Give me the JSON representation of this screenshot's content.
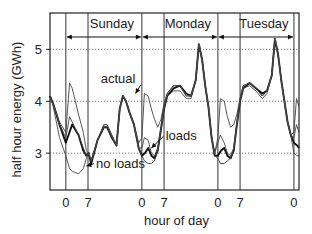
{
  "chart_data": {
    "type": "line",
    "title": "",
    "xlabel": "hour of day",
    "ylabel": "half hour energy (GWh)",
    "xlim": [
      -5,
      73.6
    ],
    "ylim": [
      2.29,
      5.7
    ],
    "yticks": [
      3,
      4,
      5
    ],
    "ytick_labels": [
      "3",
      "4",
      "5"
    ],
    "xticks": [
      0,
      7,
      24,
      31,
      48,
      55,
      72
    ],
    "xtick_labels": [
      "0",
      "7",
      "0",
      "7",
      "0",
      "7",
      "0"
    ],
    "grid": "horizontal dotted at y ticks",
    "day_spans": [
      {
        "label": "Sunday",
        "from": 0,
        "to": 24
      },
      {
        "label": "Monday",
        "from": 24,
        "to": 48
      },
      {
        "label": "Tuesday",
        "from": 48,
        "to": 72
      }
    ],
    "annotations": [
      {
        "text": "actual",
        "x": 11,
        "y": 4.35,
        "points_to": [
          22,
          4.15
        ]
      },
      {
        "text": "loads",
        "x": 31.5,
        "y": 3.25,
        "points_to": [
          27,
          3.1
        ]
      },
      {
        "text": "no loads",
        "x": 9.5,
        "y": 2.72,
        "points_to": [
          6.5,
          2.75
        ]
      }
    ],
    "series": [
      {
        "name": "actual",
        "style": "thick",
        "x": [
          -5,
          -4,
          -2,
          0,
          2,
          4,
          5.5,
          6.5,
          7.2,
          8,
          10,
          12,
          13,
          14.5,
          16,
          17,
          18,
          19,
          20,
          21.5,
          23,
          24,
          25,
          26,
          27,
          28,
          29,
          30,
          31,
          32,
          34,
          36,
          38,
          39.5,
          41,
          42,
          43,
          44,
          45,
          46,
          47,
          48,
          49,
          50,
          51,
          52,
          53,
          54,
          55,
          56,
          58,
          60,
          62,
          63.5,
          65,
          66,
          67,
          68,
          69,
          70,
          71,
          72,
          73,
          73.6
        ],
        "y": [
          4.1,
          3.95,
          3.55,
          3.2,
          3.55,
          3.35,
          3.05,
          2.95,
          3.0,
          2.8,
          3.25,
          3.5,
          3.5,
          3.3,
          3.15,
          3.85,
          4.1,
          4.0,
          3.8,
          3.55,
          3.1,
          2.95,
          3.0,
          3.1,
          2.95,
          2.9,
          3.05,
          3.45,
          3.85,
          4.1,
          4.25,
          4.3,
          4.15,
          4.1,
          4.4,
          5.1,
          4.8,
          4.3,
          3.9,
          3.3,
          2.95,
          2.95,
          3.05,
          3.1,
          2.95,
          2.9,
          3.05,
          3.55,
          4.0,
          4.25,
          4.35,
          4.25,
          4.15,
          4.2,
          4.5,
          5.2,
          4.9,
          4.4,
          4.0,
          3.6,
          3.35,
          3.2,
          3.15,
          3.1
        ]
      },
      {
        "name": "loads",
        "style": "thin",
        "x": [
          -5,
          -4,
          -2,
          0,
          1.2,
          2,
          4,
          5.5,
          6.5,
          7.2,
          8,
          10,
          12,
          13,
          14.5,
          16,
          17,
          18,
          19,
          20,
          21.5,
          23,
          24,
          24.8,
          26,
          27,
          28,
          29,
          30,
          31,
          32,
          34,
          36,
          38,
          39.5,
          41,
          42,
          43,
          44,
          45,
          46,
          47,
          48,
          48.8,
          50,
          51,
          52,
          53,
          54,
          55,
          56,
          58,
          60,
          62,
          63.5,
          65,
          66,
          67,
          68,
          69,
          70,
          71,
          72,
          72.8,
          73.6
        ],
        "y": [
          4.1,
          3.95,
          3.55,
          3.3,
          3.7,
          3.6,
          3.35,
          3.1,
          2.95,
          3.0,
          2.85,
          3.25,
          3.55,
          3.55,
          3.35,
          3.15,
          3.85,
          4.1,
          4.0,
          3.8,
          3.55,
          3.1,
          3.1,
          3.3,
          3.25,
          3.0,
          2.95,
          3.1,
          3.5,
          3.9,
          4.15,
          4.3,
          4.3,
          4.1,
          4.1,
          4.4,
          5.1,
          4.8,
          4.3,
          3.9,
          3.3,
          3.0,
          3.2,
          3.35,
          3.2,
          3.0,
          2.95,
          3.1,
          3.6,
          4.05,
          4.3,
          4.35,
          4.25,
          4.1,
          4.2,
          4.5,
          5.2,
          4.9,
          4.4,
          4.0,
          3.6,
          3.35,
          3.3,
          3.55,
          3.4
        ]
      },
      {
        "name": "no loads",
        "style": "thin",
        "x": [
          -5,
          -4,
          -2,
          0,
          1.2,
          2,
          4,
          5.5,
          6.5,
          7.2,
          8,
          10,
          12,
          13,
          14.5,
          16,
          17,
          18,
          19,
          20,
          21.5,
          23,
          24,
          24.8,
          26,
          27,
          28,
          29,
          30,
          31,
          32,
          34,
          36,
          38,
          39.5,
          41,
          42,
          43,
          44,
          45,
          46,
          47,
          48,
          48.8,
          50,
          51,
          52,
          53,
          54,
          55,
          56,
          58,
          60,
          62,
          63.5,
          65,
          66,
          67,
          68,
          69,
          70,
          71,
          72,
          72.8,
          73.6
        ],
        "y": [
          4.1,
          3.9,
          3.3,
          2.95,
          2.7,
          2.65,
          2.6,
          2.7,
          2.9,
          3.0,
          2.85,
          3.25,
          3.5,
          3.5,
          3.3,
          3.15,
          3.85,
          4.1,
          4.0,
          3.8,
          3.55,
          3.1,
          2.95,
          2.85,
          2.8,
          2.8,
          2.85,
          3.05,
          3.45,
          3.85,
          4.1,
          4.2,
          4.2,
          4.05,
          4.05,
          4.4,
          5.1,
          4.8,
          4.3,
          3.9,
          3.3,
          2.95,
          2.9,
          2.8,
          2.8,
          2.85,
          2.9,
          3.05,
          3.55,
          4.0,
          4.25,
          4.3,
          4.2,
          4.05,
          4.15,
          4.5,
          5.2,
          4.9,
          4.4,
          4.0,
          3.6,
          3.35,
          3.0,
          2.95,
          2.95
        ]
      },
      {
        "name": "loads-upper",
        "style": "thin",
        "x": [
          -5,
          -4,
          -2,
          0,
          1.2,
          2,
          3,
          4,
          5.5,
          6.5,
          7.2,
          8,
          10,
          12,
          13,
          14.5,
          16,
          17,
          18,
          19,
          20,
          21.5,
          23,
          24,
          24.8,
          26,
          27,
          28,
          29,
          30,
          31,
          32,
          34,
          36,
          38,
          39.5,
          41,
          42,
          43,
          44,
          45,
          46,
          47,
          48,
          48.8,
          50,
          51,
          52,
          53,
          54,
          55,
          56,
          58,
          60,
          62,
          63.5,
          65,
          66,
          67,
          68,
          69,
          70,
          71,
          72,
          72.8,
          73.6
        ],
        "y": [
          4.1,
          3.95,
          3.6,
          3.4,
          4.35,
          4.25,
          4.0,
          3.75,
          3.4,
          3.05,
          3.0,
          2.85,
          3.25,
          3.55,
          3.55,
          3.35,
          3.15,
          3.85,
          4.1,
          4.0,
          3.8,
          3.55,
          3.2,
          3.3,
          4.15,
          4.1,
          3.85,
          3.65,
          3.5,
          3.65,
          3.95,
          4.15,
          4.3,
          4.3,
          4.1,
          4.1,
          4.4,
          5.1,
          4.8,
          4.3,
          3.9,
          3.3,
          3.0,
          3.3,
          4.05,
          4.0,
          3.7,
          3.5,
          3.55,
          3.75,
          4.05,
          4.3,
          4.35,
          4.25,
          4.1,
          4.2,
          4.5,
          5.2,
          4.9,
          4.4,
          4.0,
          3.6,
          3.35,
          3.4,
          4.05,
          3.9
        ]
      }
    ]
  }
}
